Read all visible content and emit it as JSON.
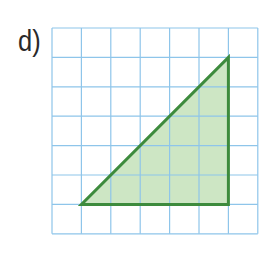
{
  "exercise": {
    "label": "d)"
  },
  "grid": {
    "columns": 7,
    "rows": 7,
    "origin_px": [
      52,
      28
    ],
    "cell_px": 29.4,
    "line_color": "#8ec5ea"
  },
  "triangle": {
    "vertices_grid": [
      [
        1,
        6
      ],
      [
        6,
        6
      ],
      [
        6,
        1
      ]
    ],
    "fill_color": "#cde6c4",
    "stroke_color": "#3d8b3d",
    "base_units": 5,
    "height_units": 5
  }
}
